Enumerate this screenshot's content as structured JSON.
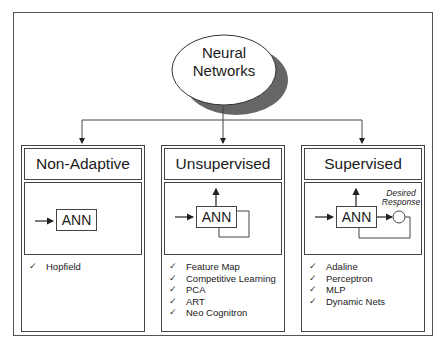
{
  "root": {
    "label_line1": "Neural",
    "label_line2": "Networks"
  },
  "panels": [
    {
      "title": "Non-Adaptive",
      "block_label": "ANN",
      "items": [
        "Hopfield"
      ]
    },
    {
      "title": "Unsupervised",
      "block_label": "ANN",
      "items": [
        "Feature Map",
        "Competitive Learning",
        "PCA",
        "ART",
        "Neo Cognitron"
      ]
    },
    {
      "title": "Supervised",
      "block_label": "ANN",
      "desired_line1": "Desired",
      "desired_line2": "Response",
      "items": [
        "Adaline",
        "Perceptron",
        "MLP",
        "Dynamic Nets"
      ]
    }
  ],
  "check_glyph": "✓",
  "colors": {
    "line": "#444444",
    "shadow": "#666666",
    "background": "#ffffff"
  }
}
